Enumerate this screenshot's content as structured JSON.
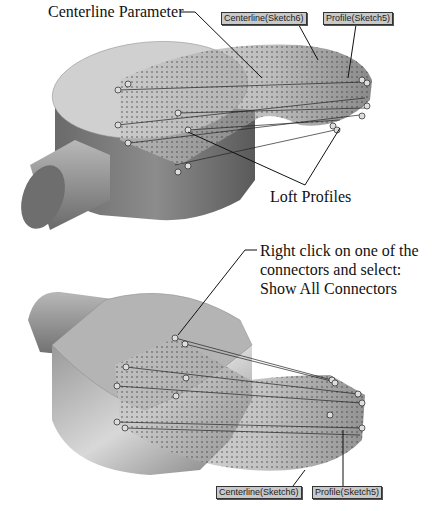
{
  "figure_top": {
    "callout_centerline": "Centerline Parameter",
    "callout_profiles": "Loft Profiles",
    "tag_centerline": "Centerline(Sketch6)",
    "tag_profile": "Profile(Sketch5)"
  },
  "figure_bottom": {
    "callout_line1": "Right click on one of the",
    "callout_line2": "connectors and select:",
    "callout_line3": "Show All Connectors",
    "tag_centerline": "Centerline(Sketch6)",
    "tag_profile": "Profile(Sketch5)"
  }
}
